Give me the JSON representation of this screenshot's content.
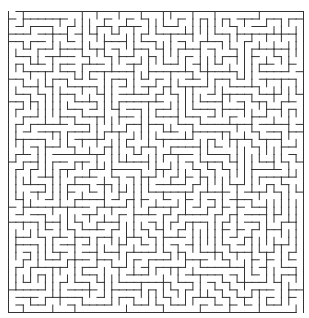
{
  "maze": {
    "cols": 40,
    "rows": 40,
    "origin_x": 8,
    "origin_y": 11,
    "width": 295,
    "height": 301,
    "wall_color": "#333333",
    "background": "#ffffff",
    "wall_width": 1,
    "seed": 12345,
    "entrance": {
      "side": "top",
      "col": 0
    },
    "exit": {
      "side": "bottom",
      "col": 39
    }
  }
}
